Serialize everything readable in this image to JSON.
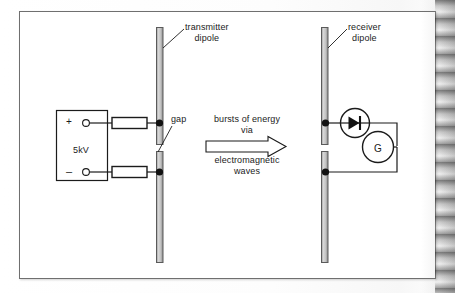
{
  "figure": {
    "type": "physics-circuit-diagram",
    "title_text": "",
    "labels": {
      "transmitter_dipole": "transmitter\ndipole",
      "transmitter_dipole_line1": "transmitter",
      "transmitter_dipole_line2": "dipole",
      "receiver_dipole_line1": "receiver",
      "receiver_dipole_line2": "dipole",
      "gap": "gap",
      "supply_voltage": "5kV",
      "terminal_positive": "+",
      "terminal_negative": "–",
      "galvanometer": "G",
      "energy_line1": "bursts of energy",
      "energy_line2": "via",
      "energy_line3": "electromagnetic",
      "energy_line4": "waves"
    },
    "components": [
      {
        "name": "high-voltage-power-supply",
        "label": "5kV"
      },
      {
        "name": "resistor-top",
        "label": ""
      },
      {
        "name": "resistor-bottom",
        "label": ""
      },
      {
        "name": "transmitter-dipole-upper-rod",
        "label": ""
      },
      {
        "name": "transmitter-dipole-lower-rod",
        "label": ""
      },
      {
        "name": "spark-gap",
        "label": "gap"
      },
      {
        "name": "receiver-dipole-upper-rod",
        "label": ""
      },
      {
        "name": "receiver-dipole-lower-rod",
        "label": ""
      },
      {
        "name": "diode",
        "label": ""
      },
      {
        "name": "galvanometer",
        "label": "G"
      },
      {
        "name": "energy-arrow",
        "label": "bursts of energy via electromagnetic waves"
      }
    ],
    "colors": {
      "ink": "#1b1b1b",
      "frame_border": "#6f6f6f",
      "rod_fill": "#c9c9c9",
      "rod_edge": "#5a5a5a",
      "paper": "#ffffff"
    }
  }
}
